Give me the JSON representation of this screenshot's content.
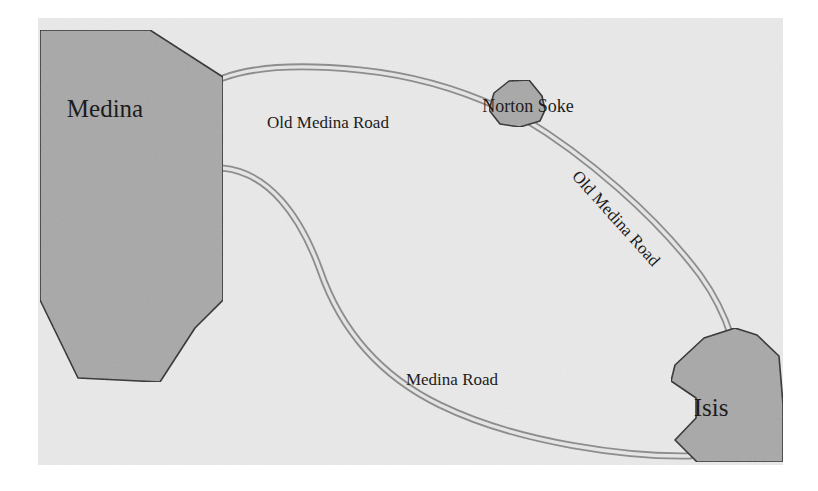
{
  "map": {
    "canvas": {
      "width": 818,
      "height": 491,
      "page_background": "#ffffff",
      "map_background": "#e9e9e9",
      "map_rect": {
        "x": 38,
        "y": 18,
        "width": 745,
        "height": 447
      }
    },
    "style": {
      "region_fill": "#a8a8a8",
      "region_stroke": "#2b2b2b",
      "region_stroke_width": 1.6,
      "road_casing": "#8d8d8d",
      "road_fill": "#e4e4e4",
      "road_casing_width": 7.0,
      "road_fill_width": 3.4,
      "label_color": "#1c1c1c"
    },
    "regions": [
      {
        "name": "Medina",
        "label": "Medina",
        "label_x": 105,
        "label_y": 117,
        "font_size": 25,
        "rotation": 0,
        "points": "40,30 150,30 223,77 223,166 223,300 195,328 160,382 78,378 40,300 40,98"
      },
      {
        "name": "Norton Soke",
        "label": "Norton Soke",
        "label_x": 528,
        "label_y": 112,
        "font_size": 18,
        "rotation": 0,
        "points": "489,110 494,93 509,81 529,80 542,96 545,110 540,121 520,127 500,124"
      },
      {
        "name": "Isis",
        "label": "Isis",
        "label_x": 711,
        "label_y": 416,
        "font_size": 25,
        "rotation": 0,
        "points": "704,338 735,328 757,335 779,356 783,404 783,462 697,462 690,455 675,440 696,418 696,398 671,381 675,365"
      }
    ],
    "roads": [
      {
        "name": "Old Medina Road (north)",
        "label": "Old Medina Road",
        "label_x": 328,
        "label_y": 128,
        "font_size": 17,
        "rotation": 0,
        "path": "M 223,78 C 255,66 300,64 360,70 C 420,76 465,92 500,108"
      },
      {
        "name": "Old Medina Road (east)",
        "label": "Old Medina Road",
        "label_x": 612,
        "label_y": 222,
        "font_size": 17,
        "rotation": 48,
        "path": "M 523,118 C 585,155 655,215 700,275 C 718,300 726,320 731,336"
      },
      {
        "name": "Medina Road (south)",
        "label": "Medina Road",
        "label_x": 452,
        "label_y": 385,
        "font_size": 17,
        "rotation": 0,
        "path": "M 222,168 C 268,172 300,215 320,270 C 338,322 372,372 440,405 C 520,444 630,457 690,456"
      }
    ]
  }
}
